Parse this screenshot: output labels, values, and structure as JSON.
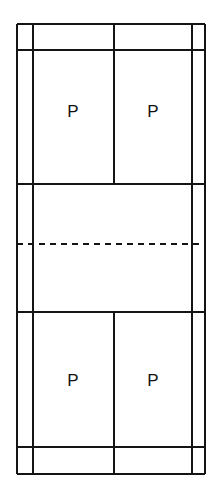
{
  "diagram": {
    "type": "court-plan",
    "orientation": "vertical",
    "background_color": "#ffffff",
    "line_color": "#141414",
    "canvas": {
      "width": 216,
      "height": 498
    },
    "geometry": {
      "x": {
        "left_doubles_sideline": 17,
        "left_singles_sideline": 33,
        "centre_line": 114,
        "right_singles_sideline": 192,
        "right_doubles_sideline": 205
      },
      "y": {
        "top_baseline": 24,
        "top_doubles_long_service_line": 50,
        "top_short_service_line": 184,
        "net_line": 244,
        "bottom_short_service_line": 312,
        "bottom_doubles_long_service_line": 447,
        "bottom_baseline": 474
      }
    },
    "lines": [
      {
        "name": "top-baseline",
        "kind": "solid",
        "orientation": "horizontal",
        "y": 24,
        "x1": 17,
        "x2": 205,
        "weight": 2
      },
      {
        "name": "top-doubles-long-service-line",
        "kind": "solid",
        "orientation": "horizontal",
        "y": 50,
        "x1": 17,
        "x2": 205,
        "weight": 2
      },
      {
        "name": "top-short-service-line",
        "kind": "solid",
        "orientation": "horizontal",
        "y": 184,
        "x1": 17,
        "x2": 205,
        "weight": 2
      },
      {
        "name": "net-line",
        "kind": "dashed",
        "orientation": "horizontal",
        "y": 244,
        "x1": 17,
        "x2": 205,
        "weight": 2
      },
      {
        "name": "bottom-short-service-line",
        "kind": "solid",
        "orientation": "horizontal",
        "y": 312,
        "x1": 17,
        "x2": 205,
        "weight": 2
      },
      {
        "name": "bottom-doubles-long-service-line",
        "kind": "solid",
        "orientation": "horizontal",
        "y": 447,
        "x1": 17,
        "x2": 205,
        "weight": 2
      },
      {
        "name": "bottom-baseline",
        "kind": "solid",
        "orientation": "horizontal",
        "y": 474,
        "x1": 17,
        "x2": 205,
        "weight": 2
      },
      {
        "name": "left-doubles-sideline",
        "kind": "solid",
        "orientation": "vertical",
        "x": 17,
        "y1": 24,
        "y2": 474,
        "weight": 2
      },
      {
        "name": "left-singles-sideline",
        "kind": "solid",
        "orientation": "vertical",
        "x": 33,
        "y1": 24,
        "y2": 474,
        "weight": 2
      },
      {
        "name": "right-singles-sideline",
        "kind": "solid",
        "orientation": "vertical",
        "x": 192,
        "y1": 24,
        "y2": 474,
        "weight": 2
      },
      {
        "name": "right-doubles-sideline",
        "kind": "solid",
        "orientation": "vertical",
        "x": 205,
        "y1": 24,
        "y2": 474,
        "weight": 2
      },
      {
        "name": "centre-line-top",
        "kind": "solid",
        "orientation": "vertical",
        "x": 114,
        "y1": 24,
        "y2": 184,
        "weight": 2
      },
      {
        "name": "centre-line-bottom",
        "kind": "solid",
        "orientation": "vertical",
        "x": 114,
        "y1": 312,
        "y2": 474,
        "weight": 2
      }
    ],
    "labels": [
      {
        "name": "player-top-left",
        "text": "P",
        "x": 73,
        "y": 113
      },
      {
        "name": "player-top-right",
        "text": "P",
        "x": 153,
        "y": 113
      },
      {
        "name": "player-bottom-left",
        "text": "P",
        "x": 73,
        "y": 382
      },
      {
        "name": "player-bottom-right",
        "text": "P",
        "x": 153,
        "y": 382
      }
    ],
    "service_courts": [
      {
        "name": "top-left-service-court",
        "x": 33,
        "y": 50,
        "width": 81,
        "height": 134
      },
      {
        "name": "top-right-service-court",
        "x": 114,
        "y": 50,
        "width": 78,
        "height": 134
      },
      {
        "name": "bottom-left-service-court",
        "x": 33,
        "y": 312,
        "width": 81,
        "height": 135
      },
      {
        "name": "bottom-right-service-court",
        "x": 114,
        "y": 312,
        "width": 78,
        "height": 135
      }
    ]
  }
}
